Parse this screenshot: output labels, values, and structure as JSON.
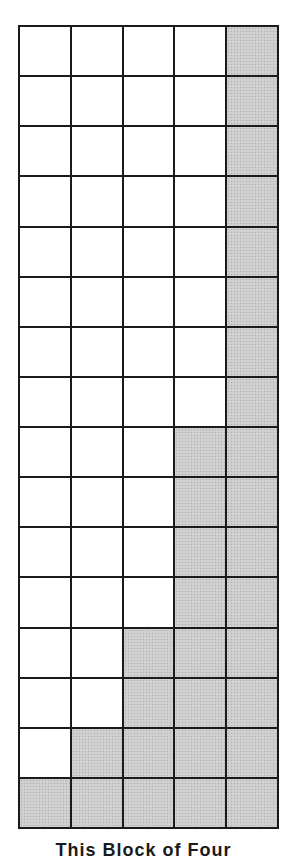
{
  "figure": {
    "columns": 5,
    "rows": 16,
    "shade_color": "#cdcdcd",
    "line_color": "#1a1a1a",
    "shaded_per_row": [
      1,
      1,
      1,
      1,
      1,
      1,
      1,
      1,
      2,
      2,
      2,
      2,
      3,
      3,
      4,
      5
    ],
    "caption": "This Block of Four"
  }
}
